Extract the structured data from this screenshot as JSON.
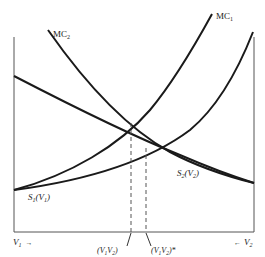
{
  "diagram": {
    "labels": {
      "mc1": "MC",
      "mc1_sub": "1",
      "mc2": "MC",
      "mc2_sub": "2",
      "s1_main": "S",
      "s1_sub": "1",
      "s1_arg": "(V",
      "s1_arg_sub": "1",
      "s1_close": ")",
      "s2_main": "S",
      "s2_sub": "2",
      "s2_arg": "(V",
      "s2_arg_sub": "2",
      "s2_close": ")",
      "v1_axis": "V",
      "v1_axis_sub": "1",
      "v1_arrow": "→",
      "v2_axis": "V",
      "v2_axis_sub": "2",
      "v2_arrow": "←",
      "point_a": "(V",
      "point_a_sub1": "1",
      "point_a_mid": "V",
      "point_a_sub2": "2",
      "point_a_close": ")",
      "point_b": "(V",
      "point_b_sub1": "1",
      "point_b_mid": "V",
      "point_b_sub2": "2",
      "point_b_close": ")*"
    },
    "colors": {
      "curve": "#1a1a1a",
      "axis": "#555555",
      "dashed": "#555555",
      "text": "#222222"
    }
  }
}
